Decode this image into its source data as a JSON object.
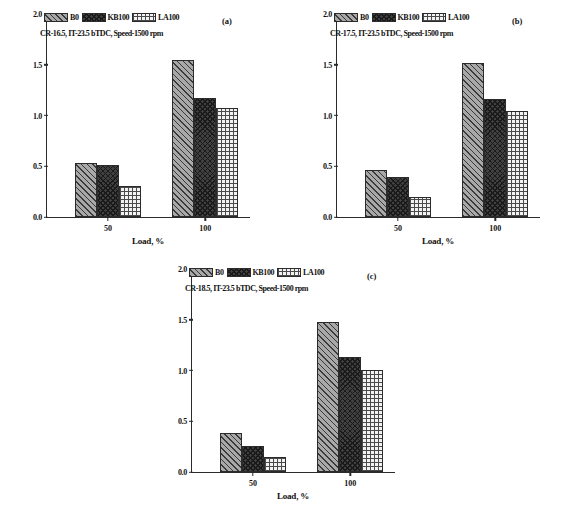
{
  "figure": {
    "caption_partial": ""
  },
  "legend": {
    "entries": [
      {
        "label": "B0",
        "pattern": "diagonal-hatch-grey"
      },
      {
        "label": "KB100",
        "pattern": "dark-crosshatch"
      },
      {
        "label": "LA100",
        "pattern": "light-square-grid"
      }
    ]
  },
  "axis": {
    "ylabel": "Smoke emission (BSN)",
    "xlabel": "Load, %",
    "yticks": [
      "0.0",
      "0.5",
      "1.0",
      "1.5",
      "2.0"
    ],
    "ytick_values": [
      0.0,
      0.5,
      1.0,
      1.5,
      2.0
    ],
    "xticks": [
      "50",
      "100"
    ],
    "ylim": [
      0.0,
      2.0
    ]
  },
  "panels": [
    {
      "tag": "(a)",
      "annotation": "CR-16.5, IT-23.5 bTDC, Speed-1500 rpm"
    },
    {
      "tag": "(b)",
      "annotation": "CR-17.5, IT-23.5 bTDC, Speed-1500 rpm"
    },
    {
      "tag": "(c)",
      "annotation": "CR-18.5, IT-23.5 bTDC, Speed-1500 rpm"
    }
  ],
  "chart_data": [
    {
      "type": "bar",
      "title": "(a)",
      "annotation": "CR-16.5, IT-23.5 bTDC, Speed-1500 rpm",
      "categories": [
        "50",
        "100"
      ],
      "series": [
        {
          "name": "B0",
          "values": [
            0.53,
            1.55
          ]
        },
        {
          "name": "KB100",
          "values": [
            0.51,
            1.17
          ]
        },
        {
          "name": "LA100",
          "values": [
            0.31,
            1.07
          ]
        }
      ],
      "xlabel": "Load, %",
      "ylabel": "Smoke emission (BSN)",
      "ylim": [
        0.0,
        2.0
      ],
      "grid": false,
      "legend_position": "top-left"
    },
    {
      "type": "bar",
      "title": "(b)",
      "annotation": "CR-17.5, IT-23.5 bTDC, Speed-1500 rpm",
      "categories": [
        "50",
        "100"
      ],
      "series": [
        {
          "name": "B0",
          "values": [
            0.46,
            1.52
          ]
        },
        {
          "name": "KB100",
          "values": [
            0.39,
            1.16
          ]
        },
        {
          "name": "LA100",
          "values": [
            0.2,
            1.04
          ]
        }
      ],
      "xlabel": "Load, %",
      "ylabel": "Smoke emission (BSN)",
      "ylim": [
        0.0,
        2.0
      ],
      "grid": false,
      "legend_position": "top-left"
    },
    {
      "type": "bar",
      "title": "(c)",
      "annotation": "CR-18.5, IT-23.5 bTDC, Speed-1500 rpm",
      "categories": [
        "50",
        "100"
      ],
      "series": [
        {
          "name": "B0",
          "values": [
            0.38,
            1.48
          ]
        },
        {
          "name": "KB100",
          "values": [
            0.26,
            1.13
          ]
        },
        {
          "name": "LA100",
          "values": [
            0.15,
            1.01
          ]
        }
      ],
      "xlabel": "Load, %",
      "ylabel": "Smoke emission (BSN)",
      "ylim": [
        0.0,
        2.0
      ],
      "grid": false,
      "legend_position": "top-left"
    }
  ]
}
